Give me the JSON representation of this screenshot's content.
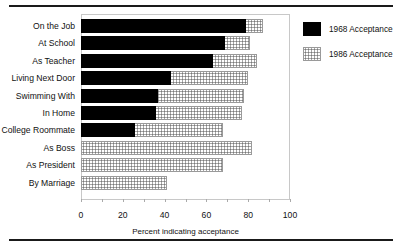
{
  "chart_data": {
    "type": "bar",
    "orientation": "horizontal",
    "title": "",
    "xlabel": "Percent indicating acceptance",
    "ylabel": "",
    "xlim": [
      0,
      100
    ],
    "xticks": [
      0,
      20,
      40,
      60,
      80,
      100
    ],
    "grid": false,
    "legend_position": "right-top",
    "categories": [
      "On the Job",
      "At School",
      "As Teacher",
      "Living Next Door",
      "Swimming With",
      "In Home",
      "College Roommate",
      "As Boss",
      "As President",
      "By Marriage"
    ],
    "series": [
      {
        "name": "1968 Acceptance",
        "color": "#000000",
        "pattern": "solid",
        "values": [
          79,
          69,
          63,
          43,
          37,
          36,
          26,
          null,
          null,
          null
        ]
      },
      {
        "name": "1986 Acceptance",
        "color": "#8a8a8a",
        "pattern": "crosshatch",
        "values": [
          87,
          81,
          84,
          80,
          78,
          77,
          68,
          82,
          68,
          41
        ]
      }
    ]
  },
  "legend": {
    "items": [
      {
        "label": "1968 Acceptance"
      },
      {
        "label": "1986 Acceptance"
      }
    ]
  },
  "axis": {
    "tick_labels": [
      "0",
      "20",
      "40",
      "60",
      "80",
      "100"
    ],
    "xlabel": "Percent indicating acceptance"
  }
}
